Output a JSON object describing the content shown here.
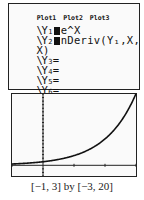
{
  "y_editor": {
    "plot_labels": [
      "Plot1",
      "Plot2",
      "Plot3"
    ],
    "functions": [
      {
        "name": "Y",
        "index": "1",
        "selected": true,
        "expr": "e^X"
      },
      {
        "name": "Y",
        "index": "2",
        "selected": true,
        "expr": "nDeriv(Y₁,X,",
        "expr_cont": "X)"
      },
      {
        "name": "Y",
        "index": "3",
        "selected": false,
        "expr": "="
      },
      {
        "name": "Y",
        "index": "4",
        "selected": false,
        "expr": "="
      },
      {
        "name": "Y",
        "index": "5",
        "selected": false,
        "expr": "="
      },
      {
        "name": "Y",
        "index": "6",
        "selected": false,
        "expr": "="
      }
    ]
  },
  "graph": {
    "function": "e^x",
    "window": {
      "xmin": -1,
      "xmax": 3,
      "ymin": -3,
      "ymax": 20,
      "xscl": 1,
      "yscl": 1
    },
    "caption": "[−1, 3] by [−3, 20]"
  }
}
